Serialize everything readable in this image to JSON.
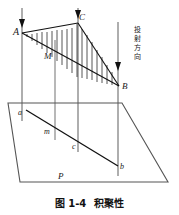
{
  "figure": {
    "caption_prefix": "图 1-4",
    "caption_title": "积聚性",
    "projection_text": "投射方向",
    "projection_chars": [
      "投",
      "射",
      "方",
      "向"
    ],
    "line_color": "#1a1a1a",
    "ray_color": "#8a8a8a",
    "hatch_color": "#2b2b2b",
    "background": "#ffffff"
  },
  "labels": {
    "A": "A",
    "C": "C",
    "M": "M",
    "B": "B",
    "a": "a",
    "m": "m",
    "c": "c",
    "b": "b",
    "P": "P"
  },
  "geometry": {
    "points": {
      "A": [
        22,
        33
      ],
      "C": [
        78,
        23
      ],
      "B": [
        119,
        86
      ],
      "M": [
        53,
        52
      ],
      "a": [
        26,
        110
      ],
      "m": [
        55,
        131
      ],
      "c": [
        80,
        146
      ],
      "b": [
        118,
        166
      ],
      "plane_corners": [
        [
          8,
          103
        ],
        [
          122,
          103
        ],
        [
          168,
          182
        ],
        [
          20,
          182
        ]
      ]
    },
    "rays": [
      {
        "name": "ray-A",
        "x": 22,
        "y1": 8,
        "y2": 120
      },
      {
        "name": "ray-M",
        "x": 55,
        "y1": 40,
        "y2": 140
      },
      {
        "name": "ray-C",
        "x": 78,
        "y1": 8,
        "y2": 152
      },
      {
        "name": "ray-B",
        "x": 118,
        "y1": 22,
        "y2": 176
      }
    ],
    "hatch_count": 17
  }
}
